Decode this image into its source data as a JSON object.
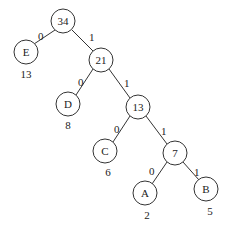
{
  "diagram": {
    "type": "huffman-tree",
    "nodes": [
      {
        "id": "n34",
        "label": "34",
        "x": 63,
        "y": 21
      },
      {
        "id": "nE",
        "label": "E",
        "x": 26,
        "y": 52,
        "weight": "13"
      },
      {
        "id": "n21",
        "label": "21",
        "x": 101,
        "y": 60
      },
      {
        "id": "nD",
        "label": "D",
        "x": 68,
        "y": 104,
        "weight": "8"
      },
      {
        "id": "n13",
        "label": "13",
        "x": 138,
        "y": 107
      },
      {
        "id": "nC",
        "label": "C",
        "x": 105,
        "y": 151,
        "weight": "6"
      },
      {
        "id": "n7",
        "label": "7",
        "x": 175,
        "y": 153
      },
      {
        "id": "nA",
        "label": "A",
        "x": 145,
        "y": 193,
        "weight": "2"
      },
      {
        "id": "nB",
        "label": "B",
        "x": 206,
        "y": 189,
        "weight": "5"
      }
    ],
    "edges": [
      {
        "from": "n34",
        "to": "nE",
        "label": "0"
      },
      {
        "from": "n34",
        "to": "n21",
        "label": "1"
      },
      {
        "from": "n21",
        "to": "nD",
        "label": "0"
      },
      {
        "from": "n21",
        "to": "n13",
        "label": "1"
      },
      {
        "from": "n13",
        "to": "nC",
        "label": "0"
      },
      {
        "from": "n13",
        "to": "n7",
        "label": "1"
      },
      {
        "from": "n7",
        "to": "nA",
        "label": "0"
      },
      {
        "from": "n7",
        "to": "nB",
        "label": "1"
      }
    ]
  }
}
